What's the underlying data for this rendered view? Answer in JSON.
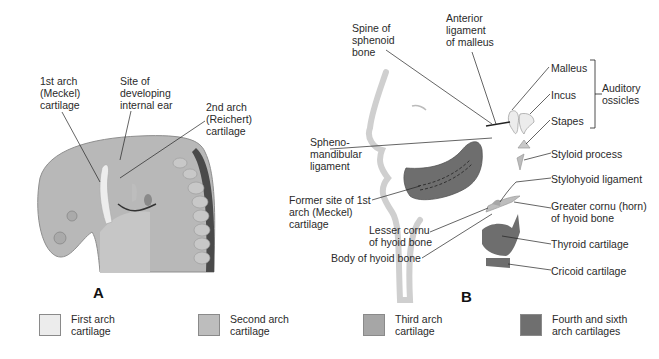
{
  "panel_a": {
    "letter": "A",
    "labels": {
      "first_arch": "1st arch\n(Meckel)\ncartilage",
      "internal_ear": "Site of\ndeveloping\ninternal ear",
      "second_arch": "2nd arch\n(Reichert)\ncartilage"
    }
  },
  "panel_b": {
    "letter": "B",
    "labels": {
      "spine_sphenoid": "Spine of\nsphenoid\nbone",
      "anterior_ligament": "Anterior\nligament\nof malleus",
      "malleus": "Malleus",
      "incus": "Incus",
      "stapes": "Stapes",
      "auditory_ossicles": "Auditory\nossicles",
      "sphenomandibular": "Spheno-\nmandibular\nligament",
      "styloid_process": "Styloid process",
      "stylohyoid_ligament": "Stylohyoid ligament",
      "former_meckel": "Former site of 1st\narch (Meckel)\ncartilage",
      "greater_cornu": "Greater cornu (horn)\nof hyoid bone",
      "lesser_cornu": "Lesser cornu\nof hyoid bone",
      "body_hyoid": "Body of hyoid bone",
      "thyroid": "Thyroid cartilage",
      "cricoid": "Cricoid cartilage"
    }
  },
  "legend": {
    "items": [
      {
        "label": "First arch\ncartilage",
        "color": "#ececec"
      },
      {
        "label": "Second arch\ncartilage",
        "color": "#bdbdbd"
      },
      {
        "label": "Third arch\ncartilage",
        "color": "#a6a6a6"
      },
      {
        "label": "Fourth and sixth\narch cartilages",
        "color": "#6f6f6f"
      }
    ]
  }
}
